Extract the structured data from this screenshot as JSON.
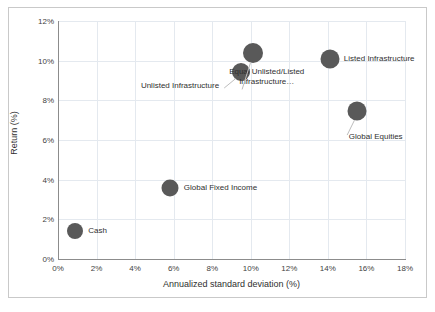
{
  "chart_data": {
    "type": "scatter",
    "title": "",
    "xlabel": "Annualized standard deviation (%)",
    "ylabel": "Return (%)",
    "xlim": [
      0,
      18
    ],
    "ylim": [
      0,
      12
    ],
    "xticks": [
      "0%",
      "2%",
      "4%",
      "6%",
      "8%",
      "10%",
      "12%",
      "14%",
      "16%",
      "18%"
    ],
    "xtick_values": [
      0,
      2,
      4,
      6,
      8,
      10,
      12,
      14,
      16,
      18
    ],
    "yticks": [
      "0%",
      "2%",
      "4%",
      "6%",
      "8%",
      "10%",
      "12%"
    ],
    "ytick_values": [
      0,
      2,
      4,
      6,
      8,
      10,
      12
    ],
    "grid": true,
    "legend": "none",
    "marker_color": "#595959",
    "points": [
      {
        "name": "Cash",
        "label": "Cash",
        "x": 0.9,
        "y": 1.4,
        "radius_px": 8,
        "label_dx": 13,
        "label_dy": 0,
        "label_align": "left",
        "leader": false
      },
      {
        "name": "Global Fixed Income",
        "label": "Global Fixed Income",
        "x": 5.8,
        "y": 3.6,
        "radius_px": 8.5,
        "label_dx": 14,
        "label_dy": 0,
        "label_align": "left",
        "leader": false
      },
      {
        "name": "Unlisted Infrastructure",
        "label": "Unlisted Infrastructure",
        "x": 9.5,
        "y": 9.45,
        "radius_px": 9,
        "label_dx": -22,
        "label_dy": 14,
        "label_align": "right",
        "leader": true
      },
      {
        "name": "Equal Unlisted/Listed Infrastructure",
        "label": "Equal Unlisted/Listed Infrastructure…",
        "x": 10.1,
        "y": 10.4,
        "radius_px": 10,
        "label_dx": 14,
        "label_dy": 32,
        "label_align": "center",
        "leader": true
      },
      {
        "name": "Listed Infrastructure",
        "label": "Listed Infrastructure",
        "x": 14.1,
        "y": 10.1,
        "radius_px": 9.5,
        "label_dx": 14,
        "label_dy": 0,
        "label_align": "left",
        "leader": false
      },
      {
        "name": "Global Equities",
        "label": "Global Equities",
        "x": 15.5,
        "y": 7.45,
        "radius_px": 9.5,
        "label_dx": -8,
        "label_dy": 26,
        "label_align": "left",
        "leader": true
      }
    ],
    "leader_lines": [
      {
        "from_name": "Unlisted Infrastructure",
        "x1": 9.22,
        "y1": 9.1,
        "x2": 8.62,
        "y2": 8.62
      },
      {
        "from_name": "Equal Unlisted/Listed Infrastructure",
        "x1": 9.98,
        "y1": 9.88,
        "x2": 9.55,
        "y2": 8.55
      },
      {
        "from_name": "Global Equities",
        "x1": 15.38,
        "y1": 7.0,
        "x2": 15.0,
        "y2": 6.25
      }
    ]
  },
  "colors": {
    "marker": "#595959",
    "grid": "#e4e9ef",
    "axis": "#8c8c8c",
    "text": "#2f2f2f",
    "frame": "#c9c9c9",
    "background": "#ffffff"
  }
}
